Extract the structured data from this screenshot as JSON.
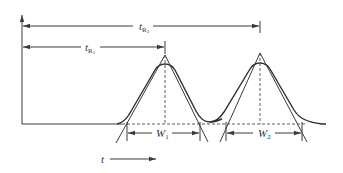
{
  "diagram": {
    "type": "chromatogram-retention-time-and-peak-width",
    "labels": {
      "tR2": {
        "main": "t",
        "sub": "R",
        "subsub": "2"
      },
      "tR1": {
        "main": "t",
        "sub": "R",
        "subsub": "1"
      },
      "W1": {
        "main": "W",
        "sub": "1"
      },
      "W2": {
        "main": "W",
        "sub": "2"
      },
      "time_axis": "t"
    },
    "colors": {
      "line": "#3a3a3a",
      "background": "#ffffff"
    }
  }
}
